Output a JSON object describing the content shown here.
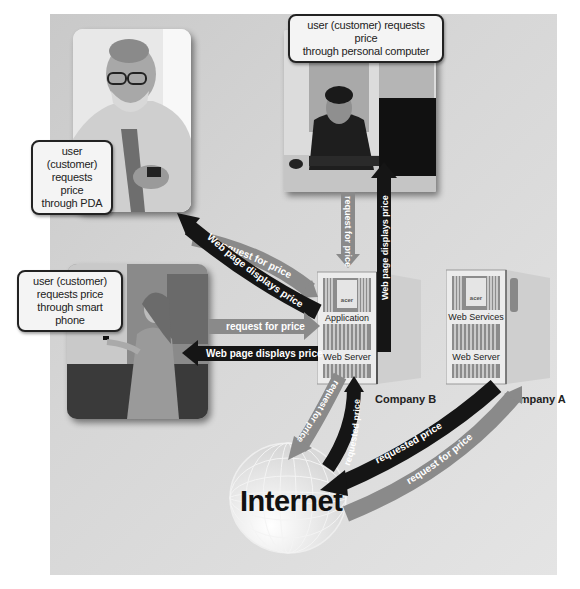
{
  "diagram": {
    "users": [
      {
        "id": "pda",
        "callout": [
          "user (customer)",
          "requests price",
          "through PDA"
        ]
      },
      {
        "id": "pc",
        "callout": [
          "user (customer) requests price",
          "through personal computer"
        ]
      },
      {
        "id": "phone",
        "callout": [
          "user (customer)",
          "requests price",
          "through smart phone"
        ]
      }
    ],
    "servers": {
      "company_b": {
        "name": "Company B",
        "labels": [
          "Application",
          "Web Server"
        ],
        "brand": "acer"
      },
      "company_a": {
        "name": "Company A",
        "labels": [
          "Web Services",
          "Web Server"
        ],
        "brand": "acer"
      }
    },
    "internet_label": "Internet",
    "arrows": {
      "pda_request": "request for price",
      "pda_response": "Web page displays price",
      "pc_request": "request for price",
      "pc_response": "Web page displays price",
      "phone_request": "request for price",
      "phone_response": "Web page displays price",
      "b_to_internet": "request for price",
      "internet_to_b": "requested price",
      "a_to_internet": "requested price",
      "internet_to_a": "request for price"
    },
    "colors": {
      "request_arrow": "#8a8a8a",
      "response_arrow": "#151515",
      "panel_bg": "#d2d2d2"
    }
  }
}
